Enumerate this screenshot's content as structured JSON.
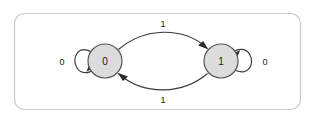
{
  "diagram": {
    "type": "finite-state-machine",
    "title": "",
    "panel": {
      "fill": "#ffffff",
      "border_color": "#c9c9c9",
      "corner_radius": 10
    },
    "colors": {
      "state_fill": "#dcdcdc",
      "state_stroke": "#555555",
      "edge_stroke": "#3a3a3a",
      "text": "#1a1a1a"
    },
    "states": [
      {
        "id": "s0",
        "label": "0",
        "cx": 105,
        "cy": 61,
        "r": 17
      },
      {
        "id": "s1",
        "label": "1",
        "cx": 221,
        "cy": 61,
        "r": 17
      }
    ],
    "transitions": [
      {
        "id": "t0-self",
        "from": "s0",
        "to": "s0",
        "label": "0",
        "kind": "self-loop",
        "side": "left",
        "label_x": 62,
        "label_y": 61
      },
      {
        "id": "t1-self",
        "from": "s1",
        "to": "s1",
        "label": "0",
        "kind": "self-loop",
        "side": "right",
        "label_x": 265,
        "label_y": 61
      },
      {
        "id": "t0-to-1",
        "from": "s0",
        "to": "s1",
        "label": "1",
        "kind": "curve-top",
        "label_x": 163,
        "label_y": 24
      },
      {
        "id": "t1-to-0",
        "from": "s1",
        "to": "s0",
        "label": "1",
        "kind": "curve-bottom",
        "label_x": 163,
        "label_y": 100
      }
    ]
  }
}
